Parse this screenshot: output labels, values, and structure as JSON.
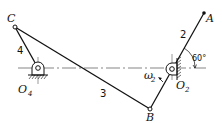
{
  "diagram": {
    "type": "four-bar linkage",
    "colors": {
      "line": "#111111",
      "background": "#ffffff",
      "centerline": "#333333"
    },
    "points": {
      "C": {
        "label": "C",
        "x": 15,
        "y": 27
      },
      "O4": {
        "label": "O",
        "sub": "4",
        "x": 38,
        "y": 69
      },
      "B": {
        "label": "B",
        "x": 150,
        "y": 109
      },
      "O2": {
        "label": "O",
        "sub": "2",
        "x": 172,
        "y": 69
      },
      "A": {
        "label": "A",
        "x": 204,
        "y": 13
      }
    },
    "links": [
      {
        "id": "4",
        "label": "4",
        "from": "O4",
        "to": "C"
      },
      {
        "id": "3",
        "label": "3",
        "from": "C",
        "to": "B"
      },
      {
        "id": "2",
        "label": "2",
        "from": "B",
        "to": "A"
      }
    ],
    "annotations": {
      "angle": "60°",
      "omega": {
        "label": "ω",
        "sub": "2"
      }
    }
  }
}
